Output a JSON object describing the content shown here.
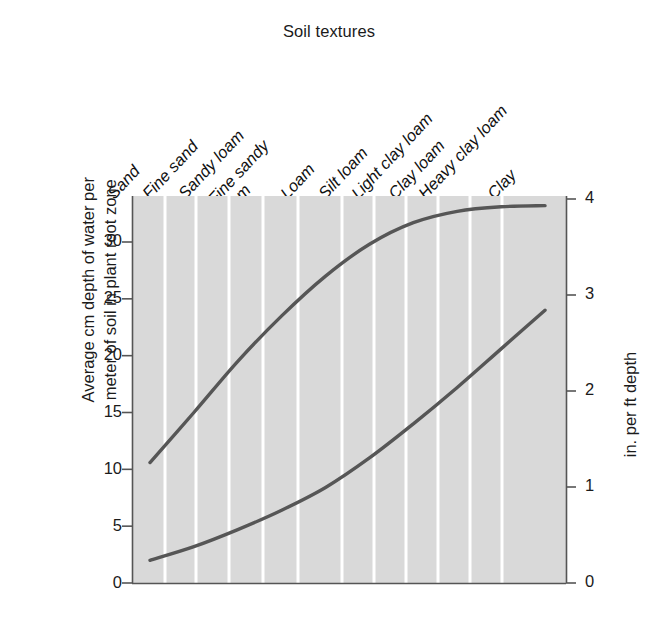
{
  "chart_data": {
    "type": "line",
    "title": "Soil textures",
    "xlabel": "Soil textures",
    "ylabel": "Average cm depth of water per meter of soil in plant root zone",
    "ylabel_right": "in. per ft depth",
    "categories": [
      "Sand",
      "Fine sand",
      "Sandy loam",
      "Fine sandy loam",
      "Loam",
      "Silt loam",
      "Light clay loam",
      "Clay loam",
      "Heavy clay loam",
      "Clay"
    ],
    "ylim": [
      0,
      34
    ],
    "yticks": [
      0,
      5,
      10,
      15,
      20,
      25,
      30
    ],
    "ylim_right": [
      0,
      4
    ],
    "yticks_right": [
      0,
      1,
      2,
      3,
      4
    ],
    "grid": true,
    "legend": "inline-labels",
    "series": [
      {
        "name": "Storage capacity",
        "values": [
          10.6,
          15.0,
          19.5,
          23.5,
          27.0,
          29.8,
          31.7,
          32.7,
          33.1,
          33.2
        ]
      },
      {
        "name": "Wilting point",
        "values": [
          2.0,
          3.2,
          4.7,
          6.4,
          8.4,
          11.0,
          14.0,
          17.2,
          20.6,
          24.0
        ]
      }
    ],
    "colors": {
      "plot_background": "#d9d9d9",
      "gridline": "#ffffff",
      "curve": "#565656",
      "axis": "#555555",
      "text": "#1b1b1b",
      "page_background": "#ffffff"
    }
  },
  "title": "Soil textures",
  "axes": {
    "left": {
      "label_line1": "Average cm depth of water per",
      "label_line2": "meter of soil in plant root zone",
      "ticks": [
        "30",
        "25",
        "20",
        "15",
        "10",
        "5",
        "0"
      ]
    },
    "right": {
      "label": "in. per ft depth",
      "ticks": [
        "4",
        "3",
        "2",
        "1",
        "0"
      ]
    }
  },
  "x_categories": [
    {
      "text": "Sand",
      "lines": [
        "Sand"
      ]
    },
    {
      "text": "Fine sand",
      "lines": [
        "Fine sand"
      ]
    },
    {
      "text": "Sandy loam",
      "lines": [
        "Sandy loam"
      ]
    },
    {
      "text": "Fine sandy loam",
      "lines": [
        "Fine sandy",
        "loam"
      ]
    },
    {
      "text": "Loam",
      "lines": [
        "Loam"
      ]
    },
    {
      "text": "Silt loam",
      "lines": [
        "Silt loam"
      ]
    },
    {
      "text": "Light clay loam",
      "lines": [
        "Light clay loam"
      ]
    },
    {
      "text": "Clay loam",
      "lines": [
        "Clay loam"
      ]
    },
    {
      "text": "Heavy clay loam",
      "lines": [
        "Heavy clay loam"
      ]
    },
    {
      "text": "Clay",
      "lines": [
        "Clay"
      ]
    }
  ],
  "curve_labels": {
    "storage": "Storage capacity",
    "wilting": "Wilting point"
  }
}
